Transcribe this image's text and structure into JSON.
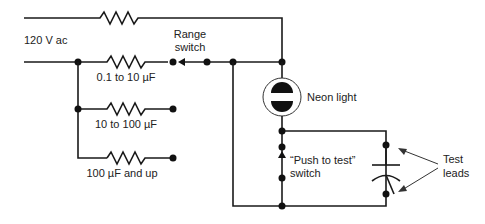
{
  "diagram": {
    "labels": {
      "source": "120 V ac",
      "range_switch_line1": "Range",
      "range_switch_line2": "switch",
      "r1": "0.1 to 10 µF",
      "r2": "10 to 100 µF",
      "r3": "100 µF and up",
      "neon": "Neon light",
      "push_line1": "“Push to test”",
      "push_line2": "switch",
      "leads_line1": "Test",
      "leads_line2": "leads"
    },
    "colors": {
      "wire": "#1a1a1a",
      "text": "#222222",
      "background": "#ffffff"
    }
  }
}
